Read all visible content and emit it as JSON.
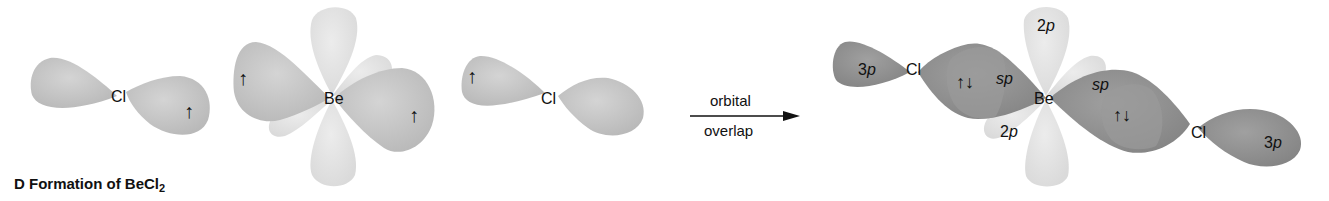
{
  "caption": {
    "prefix": "D  Formation of BeCl",
    "subscript": "2"
  },
  "left_panel": {
    "cl_left": {
      "atom": "Cl",
      "electron": "↑"
    },
    "be": {
      "atom": "Be",
      "electron_left": "↑",
      "electron_right": "↑"
    },
    "cl_right": {
      "atom": "Cl",
      "electron": "↑"
    }
  },
  "arrow": {
    "label_top": "orbital",
    "label_bottom": "overlap"
  },
  "right_panel": {
    "cl_left": {
      "atom": "Cl",
      "orbital": "3p"
    },
    "bond_left": {
      "pair": "↑↓",
      "orbital": "sp"
    },
    "be": {
      "atom": "Be",
      "orbital_top": "2p",
      "orbital_bottom": "2p"
    },
    "bond_right": {
      "pair": "↑↓",
      "orbital": "sp"
    },
    "cl_right": {
      "atom": "Cl",
      "orbital": "3p"
    }
  },
  "colors": {
    "lobe_light": "#c6c6c6",
    "lobe_faint": "#e2e2e2",
    "lobe_dark": "#8f8f8f",
    "text": "#111111"
  }
}
